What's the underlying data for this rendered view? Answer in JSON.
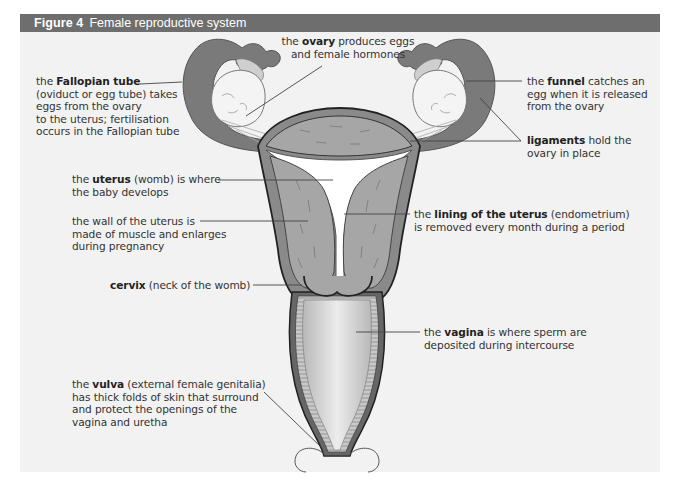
{
  "figure": {
    "number": "Figure 4",
    "title": "Female reproductive system"
  },
  "labels": {
    "fallopian": {
      "pre": "the ",
      "bold": "Fallopian tube",
      "lines": [
        "(oviduct or egg tube) takes",
        "eggs from the ovary",
        "to the uterus; fertilisation",
        "occurs in the Fallopian tube"
      ]
    },
    "ovary": {
      "pre": "the ",
      "bold": "ovary",
      "post": " produces eggs",
      "lines": [
        "and female hormones"
      ]
    },
    "funnel": {
      "pre": "the ",
      "bold": "funnel",
      "post": " catches an",
      "lines": [
        "egg when it is released",
        "from the ovary"
      ]
    },
    "ligaments": {
      "bold": "ligaments",
      "post": " hold the",
      "lines": [
        "ovary in place"
      ]
    },
    "uterus": {
      "pre": "the ",
      "bold": "uterus",
      "post": " (womb) is where",
      "lines": [
        "the baby develops"
      ]
    },
    "wall": {
      "lines": [
        "the wall of the uterus is",
        "made of muscle and enlarges",
        "during pregnancy"
      ]
    },
    "lining": {
      "pre": "the ",
      "bold": "lining of the uterus",
      "post": " (endometrium)",
      "lines": [
        "is removed every month during a period"
      ]
    },
    "cervix": {
      "bold": "cervix",
      "post": " (neck of the womb)"
    },
    "vagina": {
      "pre": "the ",
      "bold": "vagina",
      "post": " is where sperm are",
      "lines": [
        "deposited during intercourse"
      ]
    },
    "vulva": {
      "pre": "the ",
      "bold": "vulva",
      "post": " (external female genitalia)",
      "lines": [
        "has thick folds of skin that surround",
        "and protect the openings of the",
        "vagina and uretha"
      ]
    }
  },
  "colors": {
    "title_bar": "#6e6e6e",
    "panel": "#f2f2f2",
    "tissue_dark": "#7a7a7a",
    "tissue_mid": "#a8a8a8",
    "cavity": "#ffffff",
    "leader_line": "#444444"
  }
}
